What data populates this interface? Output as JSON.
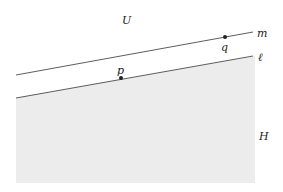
{
  "diagram": {
    "colors": {
      "background": "#ffffff",
      "shade": "#ececec",
      "line": "#333333",
      "point": "#222222"
    },
    "regions": [
      {
        "id": "U",
        "label": "U",
        "x": 126,
        "y": 20
      },
      {
        "id": "H",
        "label": "H",
        "x": 262,
        "y": 137
      }
    ],
    "lines": [
      {
        "id": "m",
        "label": "m",
        "x1": 16,
        "y1": 75,
        "x2": 253,
        "y2": 32,
        "label_x": 258,
        "label_y": 35
      },
      {
        "id": "l",
        "label": "ℓ",
        "x1": 16,
        "y1": 98,
        "x2": 253,
        "y2": 56,
        "label_x": 258,
        "label_y": 59
      }
    ],
    "points": [
      {
        "id": "q",
        "label": "q",
        "x": 225,
        "y": 37,
        "label_x": 221,
        "label_y": 51
      },
      {
        "id": "p",
        "label": "p",
        "x": 121,
        "y": 78,
        "label_x": 117,
        "label_y": 74
      }
    ],
    "shaded_half_plane": {
      "x_left": 16,
      "x_right": 255,
      "y_bottom": 183
    }
  }
}
